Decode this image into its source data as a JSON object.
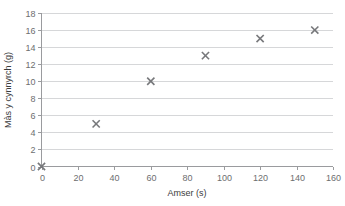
{
  "chart_data": {
    "type": "scatter",
    "title": "",
    "xlabel": "Amser (s)",
    "ylabel": "Màs y cynnyrch (g)",
    "xlim": [
      0,
      160
    ],
    "ylim": [
      0,
      18
    ],
    "xticks": [
      0,
      20,
      40,
      60,
      80,
      100,
      120,
      140,
      160
    ],
    "yticks": [
      0,
      2,
      4,
      6,
      8,
      10,
      12,
      14,
      16,
      18
    ],
    "grid": "horizontal",
    "legend": "none",
    "marker": "x",
    "marker_color": "#77787b",
    "gridline_color": "#d6d7d9",
    "axis_color": "#9a9b9e",
    "x": [
      0,
      30,
      60,
      90,
      120,
      150
    ],
    "y": [
      0,
      5,
      10,
      13,
      15,
      16
    ],
    "points": [
      {
        "x": 0,
        "y": 0
      },
      {
        "x": 30,
        "y": 5
      },
      {
        "x": 60,
        "y": 10
      },
      {
        "x": 90,
        "y": 13
      },
      {
        "x": 120,
        "y": 15
      },
      {
        "x": 150,
        "y": 16
      }
    ]
  }
}
